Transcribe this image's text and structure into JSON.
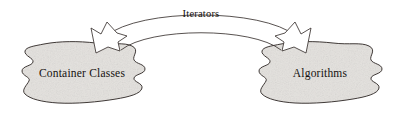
{
  "diagram": {
    "background_color": "#ffffff",
    "outline_color": "#2b2522",
    "blob_fill_color": "#ebe9e7",
    "text_color": "#15110f",
    "nodes": [
      {
        "id": "container-classes",
        "label": "Container Classes",
        "shape": "wavy-blob",
        "center_x": 82,
        "center_y": 74
      },
      {
        "id": "algorithms",
        "label": "Algorithms",
        "shape": "wavy-blob",
        "center_x": 320,
        "center_y": 74
      }
    ],
    "connector": {
      "id": "iterators-arrow",
      "label": "Iterators",
      "style": "curved-ribbon",
      "direction": "bidirectional",
      "label_x": 201,
      "label_y": 15,
      "arrowhead_fill": "#ffffff",
      "from": "container-classes",
      "to": "algorithms"
    }
  }
}
